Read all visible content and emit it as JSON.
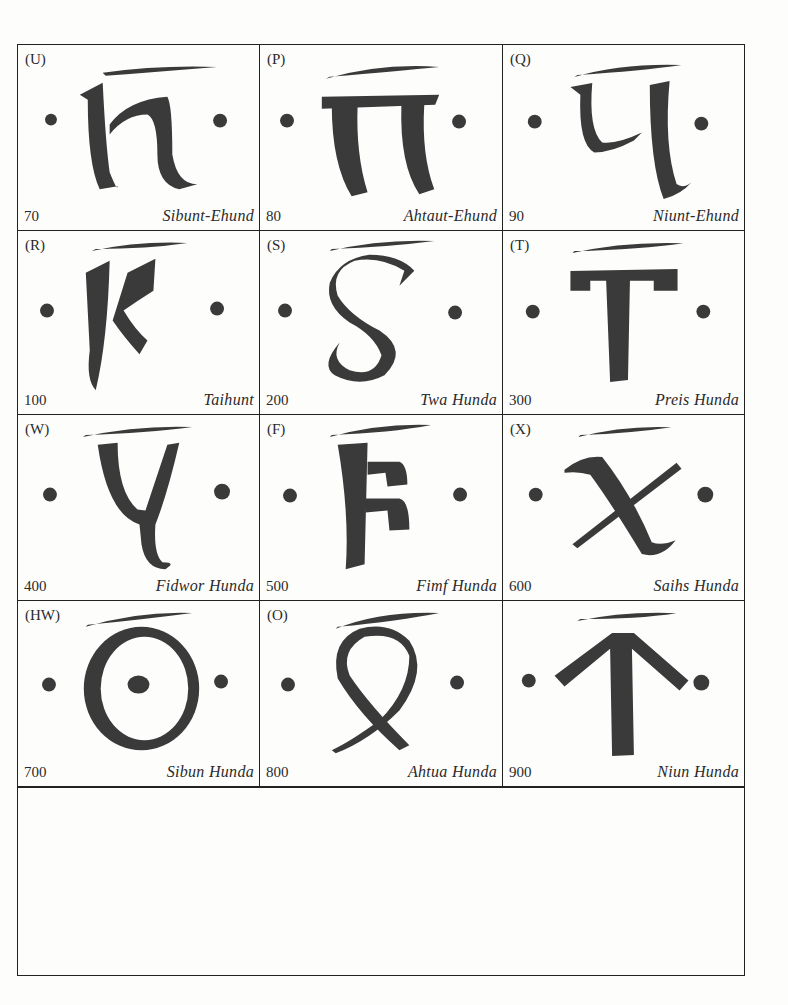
{
  "table": {
    "cells": [
      {
        "latin": "(U)",
        "value": "70",
        "name": "Sibunt-Ehund",
        "glyph": "gothic-h"
      },
      {
        "latin": "(P)",
        "value": "80",
        "name": "Ahtaut-Ehund",
        "glyph": "gothic-pi"
      },
      {
        "latin": "(Q)",
        "value": "90",
        "name": "Niunt-Ehund",
        "glyph": "gothic-q"
      },
      {
        "latin": "(R)",
        "value": "100",
        "name": "Taihunt",
        "glyph": "gothic-k"
      },
      {
        "latin": "(S)",
        "value": "200",
        "name": "Twa Hunda",
        "glyph": "gothic-s"
      },
      {
        "latin": "(T)",
        "value": "300",
        "name": "Preis Hunda",
        "glyph": "gothic-t"
      },
      {
        "latin": "(W)",
        "value": "400",
        "name": "Fidwor Hunda",
        "glyph": "gothic-y"
      },
      {
        "latin": "(F)",
        "value": "500",
        "name": "Fimf Hunda",
        "glyph": "gothic-f"
      },
      {
        "latin": "(X)",
        "value": "600",
        "name": "Saihs Hunda",
        "glyph": "gothic-x"
      },
      {
        "latin": "(HW)",
        "value": "700",
        "name": "Sibun Hunda",
        "glyph": "gothic-hw"
      },
      {
        "latin": "(O)",
        "value": "800",
        "name": "Ahtua Hunda",
        "glyph": "gothic-o"
      },
      {
        "latin": "",
        "value": "900",
        "name": "Niun Hunda",
        "glyph": "gothic-sampi"
      }
    ]
  },
  "colors": {
    "ink": "#3a3a3a",
    "border": "#222222",
    "paper": "#fdfdfc"
  }
}
